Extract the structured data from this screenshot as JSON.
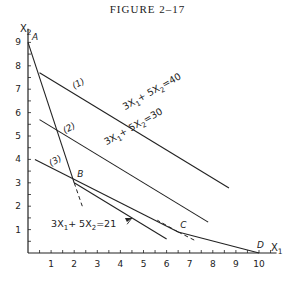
{
  "title": "FIGURE 2–17",
  "chart_data": {
    "type": "line",
    "title": "FIGURE 2–17",
    "xlabel": "X1",
    "ylabel": "X2",
    "xlim": [
      0,
      10.5
    ],
    "ylim": [
      0,
      9.5
    ],
    "x_ticks": [
      1,
      2,
      3,
      4,
      5,
      6,
      7,
      8,
      9,
      10
    ],
    "y_ticks": [
      1,
      2,
      3,
      4,
      5,
      6,
      7,
      8,
      9
    ],
    "points": [
      {
        "label": "A",
        "x": 0,
        "y": 9
      },
      {
        "label": "B",
        "x": 2,
        "y": 3
      },
      {
        "label": "C",
        "x": 6.5,
        "y": 0.9
      },
      {
        "label": "D",
        "x": 10,
        "y": 0
      }
    ],
    "series": [
      {
        "name": "constraint-AB",
        "points": [
          [
            0,
            9
          ],
          [
            2,
            3
          ]
        ],
        "dashed_extension": [
          [
            2,
            3
          ],
          [
            2.35,
            2
          ]
        ]
      },
      {
        "name": "(3)",
        "points": [
          [
            0.3,
            4
          ],
          [
            6.5,
            0.9
          ]
        ],
        "dashed_extension": [
          [
            6.5,
            0.9
          ],
          [
            7.3,
            0.5
          ]
        ]
      },
      {
        "name": "constraint-CD",
        "points": [
          [
            6.5,
            0.9
          ],
          [
            10,
            0
          ]
        ],
        "dashed_extension": [
          [
            6.5,
            0.9
          ],
          [
            5.6,
            1.4
          ]
        ]
      },
      {
        "name": "(1) 3X1+5X2=40",
        "points": [
          [
            0.5,
            7.7
          ],
          [
            8.7,
            2.78
          ]
        ]
      },
      {
        "name": "(2) 3X1+5X2=30",
        "points": [
          [
            0.5,
            5.7
          ],
          [
            7.8,
            1.32
          ]
        ]
      },
      {
        "name": "3X1+5X2=21",
        "points": [
          [
            2,
            3
          ],
          [
            6,
            0.6
          ]
        ]
      }
    ],
    "annotations": [
      {
        "text": "(1)",
        "x": 2.0,
        "y": 7.0
      },
      {
        "text": "3X1+5X2=40",
        "x": 4.2,
        "y": 6.1
      },
      {
        "text": "(2)",
        "x": 1.6,
        "y": 5.1
      },
      {
        "text": "3X1+5X2=30",
        "x": 3.4,
        "y": 4.6
      },
      {
        "text": "(3)",
        "x": 1.0,
        "y": 3.7
      },
      {
        "text": "3X1+5X2=21",
        "x": 1.0,
        "y": 1.1,
        "arrow_to": [
          4.5,
          1.5
        ]
      }
    ]
  }
}
